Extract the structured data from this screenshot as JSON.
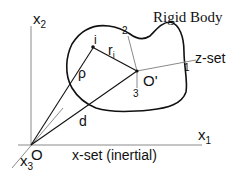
{
  "diagram": {
    "title": "Rigid Body",
    "colors": {
      "background": "#ffffff",
      "stroke_dark": "#111111",
      "stroke_light": "#8a8a8a"
    },
    "inertial_frame": {
      "label": "x-set (inertial)",
      "origin_label": "O",
      "axes": [
        {
          "name": "x1",
          "base": "x",
          "sub": "1"
        },
        {
          "name": "x2",
          "base": "x",
          "sub": "2"
        },
        {
          "name": "x3",
          "base": "x",
          "sub": "3"
        }
      ]
    },
    "body_frame": {
      "label": "z-set",
      "origin_label": "O'",
      "axes": [
        {
          "name": "1",
          "label": "1"
        },
        {
          "name": "2",
          "label": "2"
        },
        {
          "name": "3",
          "label": "3"
        }
      ]
    },
    "vectors": {
      "rho": "ρ",
      "r_i": {
        "base": "r",
        "sub": "i"
      },
      "d": "d"
    },
    "point": {
      "label": "i"
    }
  }
}
